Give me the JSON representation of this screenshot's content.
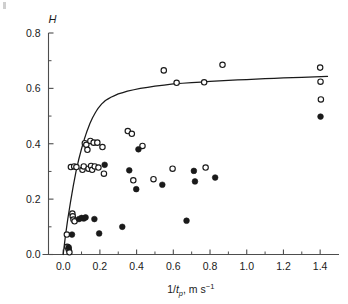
{
  "figure": {
    "background_color": "#ffffff",
    "axis_color": "#4d4d4d",
    "curve_color": "#1a1a1a",
    "marker_open_stroke": "#1a1a1a",
    "marker_filled_fill": "#1a1a1a"
  },
  "chart_data": {
    "type": "scatter",
    "title": "",
    "xlabel": "1/t_p, m s−1",
    "xlabel_parts": {
      "prefix": "1/",
      "italic_var": "t",
      "subscript": "p",
      "suffix": ", m s",
      "superscript": "−1"
    },
    "ylabel": "H",
    "xlim": [
      -0.08,
      1.47
    ],
    "ylim": [
      0.0,
      0.8
    ],
    "xticks": [
      0.0,
      0.2,
      0.4,
      0.6,
      0.8,
      1.0,
      1.2,
      1.4
    ],
    "xticklabels": [
      "0.0",
      "0.2",
      "0.4",
      "0.6",
      "0.8",
      "1.0",
      "1.2",
      "1.4"
    ],
    "yticks": [
      0.0,
      0.2,
      0.4,
      0.6,
      0.8
    ],
    "yticklabels": [
      "0.0",
      "0.2",
      "0.4",
      "0.6",
      "0.8"
    ],
    "x_minor_ticks": [
      0.1,
      0.3,
      0.5,
      0.7,
      0.9,
      1.1,
      1.3
    ],
    "y_minor_ticks": [
      0.1,
      0.3,
      0.5,
      0.7
    ],
    "grid": false,
    "legend": "none",
    "series": [
      {
        "name": "open-circles",
        "marker": "open circle",
        "points": [
          [
            0.02,
            0.072
          ],
          [
            0.022,
            0.028
          ],
          [
            0.03,
            0.018
          ],
          [
            0.034,
            0.008
          ],
          [
            0.042,
            0.316
          ],
          [
            0.05,
            0.148
          ],
          [
            0.052,
            0.138
          ],
          [
            0.056,
            0.126
          ],
          [
            0.06,
            0.318
          ],
          [
            0.062,
            0.12
          ],
          [
            0.072,
            0.316
          ],
          [
            0.105,
            0.306
          ],
          [
            0.112,
            0.318
          ],
          [
            0.118,
            0.402
          ],
          [
            0.126,
            0.396
          ],
          [
            0.132,
            0.378
          ],
          [
            0.138,
            0.31
          ],
          [
            0.148,
            0.41
          ],
          [
            0.152,
            0.32
          ],
          [
            0.158,
            0.306
          ],
          [
            0.166,
            0.404
          ],
          [
            0.172,
            0.318
          ],
          [
            0.186,
            0.404
          ],
          [
            0.192,
            0.314
          ],
          [
            0.214,
            0.388
          ],
          [
            0.222,
            0.292
          ],
          [
            0.352,
            0.446
          ],
          [
            0.374,
            0.436
          ],
          [
            0.382,
            0.268
          ],
          [
            0.432,
            0.392
          ],
          [
            0.492,
            0.272
          ],
          [
            0.548,
            0.665
          ],
          [
            0.596,
            0.31
          ],
          [
            0.618,
            0.62
          ],
          [
            0.768,
            0.622
          ],
          [
            0.776,
            0.314
          ],
          [
            0.868,
            0.685
          ],
          [
            1.4,
            0.675
          ],
          [
            1.402,
            0.624
          ],
          [
            1.404,
            0.56
          ]
        ]
      },
      {
        "name": "filled-circles",
        "marker": "filled circle",
        "points": [
          [
            0.03,
            0.026
          ],
          [
            0.048,
            0.072
          ],
          [
            0.086,
            0.128
          ],
          [
            0.1,
            0.132
          ],
          [
            0.112,
            0.13
          ],
          [
            0.122,
            0.134
          ],
          [
            0.17,
            0.128
          ],
          [
            0.196,
            0.076
          ],
          [
            0.226,
            0.324
          ],
          [
            0.322,
            0.1
          ],
          [
            0.36,
            0.304
          ],
          [
            0.398,
            0.236
          ],
          [
            0.41,
            0.38
          ],
          [
            0.54,
            0.252
          ],
          [
            0.672,
            0.122
          ],
          [
            0.712,
            0.302
          ],
          [
            0.718,
            0.264
          ],
          [
            0.828,
            0.278
          ],
          [
            1.402,
            0.498
          ]
        ]
      }
    ],
    "fitted_curve": {
      "name": "model-curve",
      "description": "monotonic saturating curve rising from origin to plateau",
      "points": [
        [
          0.0,
          0.0
        ],
        [
          0.012,
          0.066
        ],
        [
          0.025,
          0.128
        ],
        [
          0.04,
          0.19
        ],
        [
          0.055,
          0.248
        ],
        [
          0.07,
          0.3
        ],
        [
          0.085,
          0.344
        ],
        [
          0.1,
          0.382
        ],
        [
          0.115,
          0.416
        ],
        [
          0.13,
          0.446
        ],
        [
          0.145,
          0.472
        ],
        [
          0.16,
          0.494
        ],
        [
          0.175,
          0.512
        ],
        [
          0.19,
          0.528
        ],
        [
          0.21,
          0.544
        ],
        [
          0.23,
          0.556
        ],
        [
          0.26,
          0.568
        ],
        [
          0.3,
          0.58
        ],
        [
          0.35,
          0.59
        ],
        [
          0.42,
          0.6
        ],
        [
          0.5,
          0.608
        ],
        [
          0.6,
          0.616
        ],
        [
          0.7,
          0.621
        ],
        [
          0.8,
          0.625
        ],
        [
          0.9,
          0.629
        ],
        [
          1.0,
          0.632
        ],
        [
          1.1,
          0.635
        ],
        [
          1.2,
          0.638
        ],
        [
          1.3,
          0.64
        ],
        [
          1.44,
          0.643
        ]
      ]
    }
  }
}
